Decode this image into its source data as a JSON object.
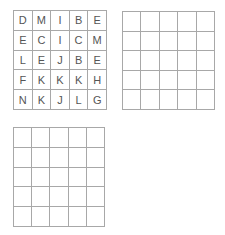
{
  "grids": [
    {
      "name": "letter-grid",
      "rows": [
        [
          "D",
          "M",
          "I",
          "B",
          "E"
        ],
        [
          "E",
          "C",
          "I",
          "C",
          "M"
        ],
        [
          "L",
          "E",
          "J",
          "B",
          "E"
        ],
        [
          "F",
          "K",
          "K",
          "K",
          "H"
        ],
        [
          "N",
          "K",
          "J",
          "L",
          "G"
        ]
      ]
    },
    {
      "name": "empty-grid-1",
      "rows": [
        [
          "",
          "",
          "",
          "",
          ""
        ],
        [
          "",
          "",
          "",
          "",
          ""
        ],
        [
          "",
          "",
          "",
          "",
          ""
        ],
        [
          "",
          "",
          "",
          "",
          ""
        ],
        [
          "",
          "",
          "",
          "",
          ""
        ]
      ]
    },
    {
      "name": "empty-grid-2",
      "rows": [
        [
          "",
          "",
          "",
          "",
          ""
        ],
        [
          "",
          "",
          "",
          "",
          ""
        ],
        [
          "",
          "",
          "",
          "",
          ""
        ],
        [
          "",
          "",
          "",
          "",
          ""
        ],
        [
          "",
          "",
          "",
          "",
          ""
        ]
      ]
    }
  ]
}
